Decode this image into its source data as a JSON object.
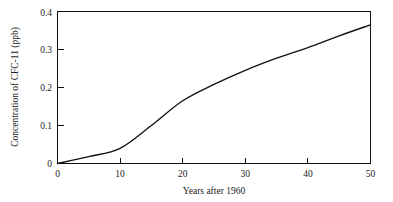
{
  "chart_data": {
    "type": "line",
    "title": "",
    "xlabel": "Years after 1960",
    "ylabel": "Concentration of CFC-11 (ppb)",
    "xlim": [
      0,
      50
    ],
    "ylim": [
      0,
      0.4
    ],
    "grid": false,
    "legend": false,
    "legend_position": "none",
    "xticks": [
      0,
      10,
      20,
      30,
      40,
      50
    ],
    "xtick_labels": [
      "0",
      "10",
      "20",
      "30",
      "40",
      "50"
    ],
    "yticks": [
      0,
      0.1,
      0.2,
      0.3,
      0.4
    ],
    "ytick_labels": [
      "0",
      "0.1",
      "0.2",
      "0.3",
      "0.4"
    ],
    "series": [
      {
        "name": "CFC-11 concentration",
        "color": "#111111",
        "x": [
          0,
          5,
          10,
          15,
          20,
          25,
          30,
          35,
          40,
          45,
          50
        ],
        "values": [
          0.0,
          0.018,
          0.04,
          0.1,
          0.165,
          0.208,
          0.245,
          0.277,
          0.305,
          0.336,
          0.365
        ]
      }
    ],
    "annotations": []
  },
  "figure": {
    "background_color": "#ffffff",
    "frame_color": "#111111"
  }
}
